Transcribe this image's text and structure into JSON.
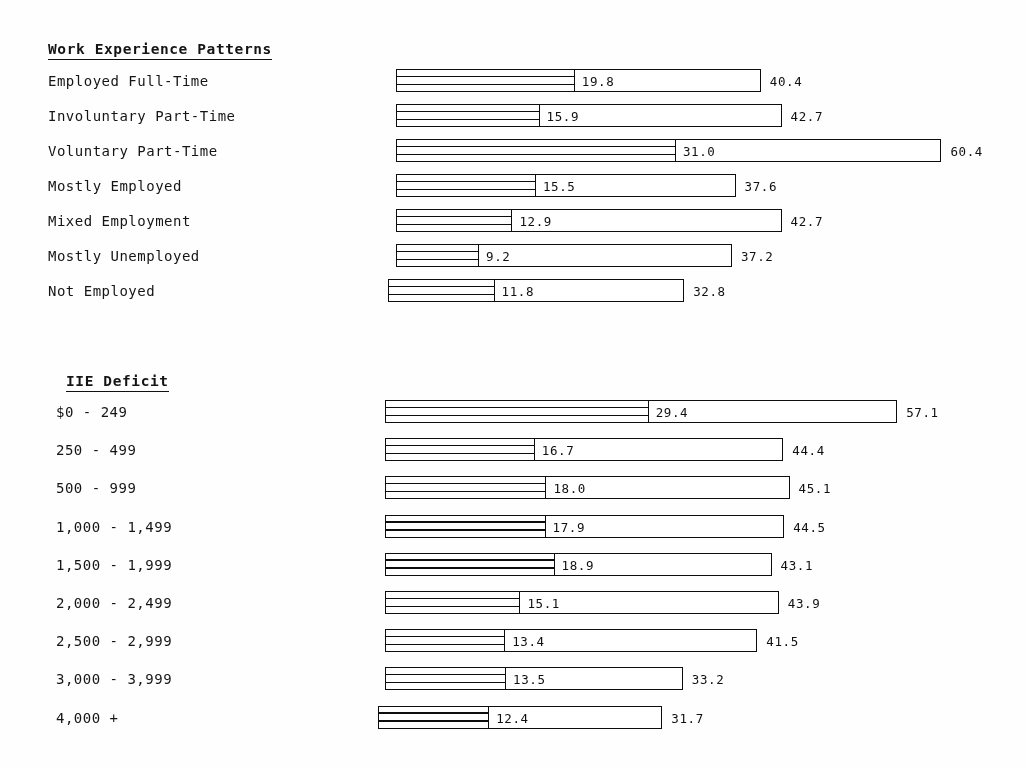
{
  "chart_data": {
    "type": "bar",
    "title": "",
    "orientation": "horizontal",
    "note": "Two grouped horizontal bar charts. Each bar shows an inner segment value and a total (end) value.",
    "xlabel": "",
    "ylabel": "",
    "xlim": [
      0,
      62
    ],
    "grid": false,
    "legend": null,
    "groups": [
      {
        "heading": "Work Experience Patterns",
        "categories": [
          "Employed Full-Time",
          "Involuntary Part-Time",
          "Voluntary Part-Time",
          "Mostly Employed",
          "Mixed Employment",
          "Mostly Unemployed",
          "Not Employed"
        ],
        "series": [
          {
            "name": "inner",
            "values": [
              19.8,
              15.9,
              31.0,
              15.5,
              12.9,
              9.2,
              11.8
            ]
          },
          {
            "name": "total",
            "values": [
              40.4,
              42.7,
              60.4,
              37.6,
              42.7,
              37.2,
              32.8
            ]
          }
        ],
        "inner_labels": [
          "19.8",
          "15.9",
          "31.0",
          "15.5",
          "12.9",
          "9.2",
          "11.8"
        ],
        "total_labels": [
          "40.4",
          "42.7",
          "60.4",
          "37.6",
          "42.7",
          "37.2",
          "32.8"
        ]
      },
      {
        "heading": "IIE Deficit",
        "categories": [
          "$0 - 249",
          "250 - 499",
          "500 - 999",
          "1,000 - 1,499",
          "1,500 - 1,999",
          "2,000 - 2,499",
          "2,500 - 2,999",
          "3,000 - 3,999",
          "4,000 +"
        ],
        "series": [
          {
            "name": "inner",
            "values": [
              29.4,
              16.7,
              18.0,
              17.9,
              18.9,
              15.1,
              13.4,
              13.5,
              12.4
            ]
          },
          {
            "name": "total",
            "values": [
              57.1,
              44.4,
              45.1,
              44.5,
              43.1,
              43.9,
              41.5,
              33.2,
              31.7
            ]
          }
        ],
        "inner_labels": [
          "29.4",
          "16.7",
          "18.0",
          "17.9",
          "18.9",
          "15.1",
          "13.4",
          "13.5",
          "12.4"
        ],
        "total_labels": [
          "57.1",
          "44.4",
          "45.1",
          "44.5",
          "43.1",
          "43.9",
          "41.5",
          "33.2",
          "31.7"
        ]
      }
    ]
  },
  "layout": {
    "groups": [
      {
        "heading_left": 48,
        "heading_top": 41,
        "label_left": 48,
        "first_row_top": 68,
        "row_pitch": 35,
        "bar_left": 396,
        "last_bar_left": 388,
        "px_per_unit": 9.03
      },
      {
        "heading_left": 66,
        "heading_top": 373,
        "label_left": 56,
        "first_row_top": 399,
        "row_pitch": 38.2,
        "bar_left": 385,
        "last_bar_left": 378,
        "px_per_unit": 8.97
      }
    ]
  }
}
